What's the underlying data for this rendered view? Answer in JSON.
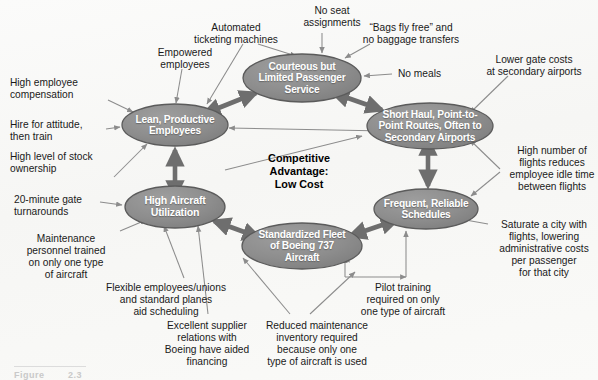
{
  "figure": {
    "title_fragment": "Figure",
    "number_fragment": "2.3"
  },
  "center": {
    "text": "Competitive Advantage:\nLow Cost"
  },
  "colors": {
    "node_fill": "#8d8d8d",
    "node_fill_light": "#9a9a9a",
    "node_stroke": "#5b5b5b",
    "node_text": "#ffffff",
    "thin_arrow": "#8c8c8c",
    "thick_arrow": "#6e6e6e",
    "label_text": "#1a1a1a",
    "page_bg": "#fbfbfa"
  },
  "nodes": [
    {
      "id": "courteous-service",
      "label": "Courteous but\nLimited Passenger\nService",
      "cx": 302,
      "cy": 78,
      "rx": 59,
      "ry": 24,
      "font_size": 10.2
    },
    {
      "id": "lean-employees",
      "label": "Lean, Productive\nEmployees",
      "cx": 175,
      "cy": 125,
      "rx": 53,
      "ry": 21,
      "font_size": 10.2
    },
    {
      "id": "short-haul-routes",
      "label": "Short Haul, Point-to-\nPoint Routes, Often to\nSecondary Airports",
      "cx": 430,
      "cy": 126,
      "rx": 63,
      "ry": 23,
      "font_size": 10.2
    },
    {
      "id": "high-aircraft-utilization",
      "label": "High Aircraft\nUtilization",
      "cx": 175,
      "cy": 207,
      "rx": 50,
      "ry": 21,
      "font_size": 10.6
    },
    {
      "id": "standardized-fleet",
      "label": "Standardized Fleet\nof Boeing 737\nAircraft",
      "cx": 302,
      "cy": 246,
      "rx": 60,
      "ry": 23,
      "font_size": 10.2
    },
    {
      "id": "frequent-schedules",
      "label": "Frequent, Reliable\nSchedules",
      "cx": 426,
      "cy": 209,
      "rx": 52,
      "ry": 20,
      "font_size": 10.2
    }
  ],
  "outer_labels": [
    {
      "id": "automated-ticketing",
      "text": "Automated\nticketing machines",
      "x": 184,
      "y": 22,
      "align": "center",
      "width": 104
    },
    {
      "id": "no-seat-assignments",
      "text": "No seat\nassignments",
      "x": 294,
      "y": 5,
      "align": "center",
      "width": 76
    },
    {
      "id": "bags-fly-free",
      "text": "“Bags fly free” and\nno baggage transfers",
      "x": 352,
      "y": 22,
      "align": "center",
      "width": 118
    },
    {
      "id": "empowered-employees",
      "text": "Empowered\nemployees",
      "x": 146,
      "y": 47,
      "align": "center",
      "width": 78
    },
    {
      "id": "no-meals",
      "text": "No meals",
      "x": 398,
      "y": 68,
      "align": "left",
      "width": 56
    },
    {
      "id": "lower-gate-costs",
      "text": "Lower gate costs\nat secondary airports",
      "x": 474,
      "y": 54,
      "align": "center",
      "width": 120
    },
    {
      "id": "high-employee-compensation",
      "text": "High employee\ncompensation",
      "x": 10,
      "y": 77,
      "align": "left",
      "width": 94
    },
    {
      "id": "hire-for-attitude",
      "text": "Hire for attitude,\nthen train",
      "x": 10,
      "y": 119,
      "align": "left",
      "width": 94
    },
    {
      "id": "high-level-stock-ownership",
      "text": "High level of stock\nownership",
      "x": 10,
      "y": 151,
      "align": "left",
      "width": 104
    },
    {
      "id": "high-number-of-flights",
      "text": "High number of\nflights reduces\nemployee idle time\nbetween flights",
      "x": 506,
      "y": 145,
      "align": "center",
      "width": 92
    },
    {
      "id": "twenty-minute-turnarounds",
      "text": "20-minute gate\nturnarounds",
      "x": 14,
      "y": 194,
      "align": "left",
      "width": 86
    },
    {
      "id": "maintenance-personnel-trained",
      "text": "Maintenance\npersonnel trained\non only one type\nof aircraft",
      "x": 14,
      "y": 233,
      "align": "center",
      "width": 104
    },
    {
      "id": "saturate-a-city",
      "text": "Saturate a city with\nflights, lowering\nadministrative costs\nper passenger\nfor that city",
      "x": 490,
      "y": 219,
      "align": "center",
      "width": 108
    },
    {
      "id": "flexible-employees-unions",
      "text": "Flexible employees/unions\nand standard planes\naid scheduling",
      "x": 96,
      "y": 282,
      "align": "center",
      "width": 140
    },
    {
      "id": "pilot-training",
      "text": "Pilot training\nrequired on only\none type of aircraft",
      "x": 348,
      "y": 282,
      "align": "center",
      "width": 110
    },
    {
      "id": "excellent-supplier-relations",
      "text": "Excellent supplier\nrelations with\nBoeing have aided\nfinancing",
      "x": 158,
      "y": 320,
      "align": "center",
      "width": 98
    },
    {
      "id": "reduced-maintenance-inventory",
      "text": "Reduced maintenance\ninventory required\nbecause only one\ntype of aircraft is used",
      "x": 256,
      "y": 320,
      "align": "center",
      "width": 122
    }
  ],
  "thin_arrows": [
    {
      "id": "arrow-automated-ticketing",
      "path": "M 258 44 L 296 56"
    },
    {
      "id": "arrow-automated-ticketing-2",
      "path": "M 243 44 L 207 104"
    },
    {
      "id": "arrow-no-seat-assignments",
      "path": "M 322 33 L 322 53"
    },
    {
      "id": "arrow-bags-fly-free",
      "path": "M 370 44 L 345 58"
    },
    {
      "id": "arrow-empowered-employees",
      "path": "M 182 69 L 176 103"
    },
    {
      "id": "arrow-no-meals",
      "path": "M 392 74 L 364 76"
    },
    {
      "id": "arrow-lower-gate-costs",
      "path": "M 508 76 L 470 113"
    },
    {
      "id": "arrow-high-employee-compensation",
      "path": "M 108 100 L 133 112"
    },
    {
      "id": "arrow-hire-for-attitude",
      "path": "M 106 129 L 120 127"
    },
    {
      "id": "arrow-high-level-stock",
      "path": "M 114 177 L 147 144"
    },
    {
      "id": "arrow-high-number-flights-a",
      "path": "M 500 169 L 470 140"
    },
    {
      "id": "arrow-high-number-flights-b",
      "path": "M 500 172 L 471 196"
    },
    {
      "id": "arrow-twenty-minute-turnarounds",
      "path": "M 100 202 L 122 205"
    },
    {
      "id": "arrow-maintenance-personnel",
      "path": "M 120 231 L 146 220"
    },
    {
      "id": "arrow-saturate-city",
      "path": "M 488 224 L 460 219"
    },
    {
      "id": "arrow-flexible-employees",
      "path": "M 184 278 L 164 226"
    },
    {
      "id": "arrow-pilot-training-a",
      "path": "M 345 277 L 345 257"
    },
    {
      "id": "arrow-pilot-training-stem",
      "path": "M 345 277 L 406 277"
    },
    {
      "id": "arrow-pilot-training-b",
      "path": "M 406 277 L 406 231"
    },
    {
      "id": "arrow-excellent-supplier",
      "path": "M 208 314 L 198 226"
    },
    {
      "id": "arrow-reduced-maintenance-a",
      "path": "M 290 314 L 243 258"
    },
    {
      "id": "arrow-reduced-maintenance-b",
      "path": "M 310 314 L 355 272"
    },
    {
      "id": "arrow-inner-diag-courteous",
      "path": "M 225 170 L 362 136"
    },
    {
      "id": "arrow-inner-diag-lean",
      "path": "M 490 133 L 229 128"
    },
    {
      "id": "arrow-fleet-to-util",
      "path": "M 350 262 L 215 224"
    }
  ],
  "thick_arrows": [
    {
      "id": "ring-lean-to-courteous",
      "from": "lean-employees",
      "to": "courteous-service",
      "x1": 216,
      "y1": 109,
      "x2": 256,
      "y2": 93,
      "double": true
    },
    {
      "id": "ring-courteous-to-shorthaul",
      "from": "courteous-service",
      "to": "short-haul-routes",
      "x1": 345,
      "y1": 97,
      "x2": 382,
      "y2": 110,
      "double": true
    },
    {
      "id": "ring-shorthaul-to-frequent",
      "from": "short-haul-routes",
      "to": "frequent-schedules",
      "x1": 428,
      "y1": 152,
      "x2": 428,
      "y2": 186,
      "double": true
    },
    {
      "id": "ring-frequent-to-fleet",
      "from": "frequent-schedules",
      "to": "standardized-fleet",
      "x1": 385,
      "y1": 224,
      "x2": 350,
      "y2": 236,
      "double": true
    },
    {
      "id": "ring-fleet-to-util",
      "from": "standardized-fleet",
      "to": "high-aircraft-utilization",
      "x1": 247,
      "y1": 233,
      "x2": 214,
      "y2": 221,
      "double": true
    },
    {
      "id": "ring-util-to-lean",
      "from": "high-aircraft-utilization",
      "to": "lean-employees",
      "x1": 175,
      "y1": 184,
      "x2": 175,
      "y2": 150,
      "double": true
    }
  ]
}
